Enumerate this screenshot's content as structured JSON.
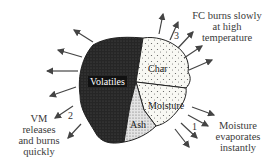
{
  "diagram": {
    "components": {
      "volatiles": "Volatiles",
      "char": "Char",
      "moisture": "Moisture",
      "ash": "Ash"
    },
    "annotations": {
      "stage1": {
        "number": "1",
        "line1": "Moisture",
        "line2": "evaporates",
        "line3": "instantly"
      },
      "stage2": {
        "number": "2",
        "line1": "VM",
        "line2": "releases",
        "line3": "and burns",
        "line4": "quickly"
      },
      "stage3": {
        "number": "3",
        "line1": "FC burns slowly",
        "line2": "at high",
        "line3": "temperature"
      }
    },
    "colors": {
      "volatiles_fill": "#2b2b2b",
      "char_fill": "#f7f7f2",
      "ash_fill": "#d9d9d9",
      "arrow": "#444444"
    }
  }
}
